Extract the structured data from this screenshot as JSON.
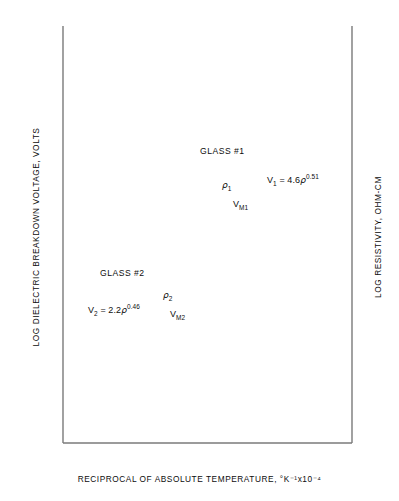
{
  "chart_data": {
    "type": "line",
    "title": "",
    "xlabel": "RECIPROCAL OF ABSOLUTE TEMPERATURE, °K⁻¹x10⁻⁴",
    "ylabel": "LOG DIELECTRIC BREAKDOWN VOLTAGE, VOLTS",
    "ylabel_right": "LOG RESISTIVITY, OHM-CM",
    "grid": false,
    "legend": "none",
    "x_axis": {
      "scale": "linear",
      "min": 24,
      "max": 18,
      "direction": "decreasing",
      "ticks": [
        24,
        23,
        22,
        21,
        20,
        19,
        18
      ]
    },
    "y_axis_left": {
      "scale": "log",
      "min": 100,
      "max": 6000,
      "label_decades": [
        "10²",
        "10³"
      ],
      "ticks": [
        {
          "value": 100,
          "label": "10²"
        },
        {
          "value": 150,
          "label": "1.5"
        },
        {
          "value": 200,
          "label": "2"
        },
        {
          "value": 300,
          "label": "3"
        },
        {
          "value": 400,
          "label": "4"
        },
        {
          "value": 500,
          "label": "5"
        },
        {
          "value": 600,
          "label": "6"
        },
        {
          "value": 700,
          "label": "7"
        },
        {
          "value": 800,
          "label": "8"
        },
        {
          "value": 900,
          "label": "9"
        },
        {
          "value": 1000,
          "label": "10³"
        },
        {
          "value": 1500,
          "label": "1.5"
        },
        {
          "value": 2000,
          "label": "2"
        },
        {
          "value": 3000,
          "label": "3"
        },
        {
          "value": 4000,
          "label": "4"
        },
        {
          "value": 5000,
          "label": "5"
        },
        {
          "value": 6000,
          "label": "6"
        }
      ]
    },
    "y_axis_right": {
      "scale": "log",
      "min": 100000,
      "max": 400000000,
      "ticks": [
        {
          "value": 100000,
          "label": "10⁵"
        },
        {
          "value": 100000,
          "label": "1"
        },
        {
          "value": 200000,
          "label": "2"
        },
        {
          "value": 400000,
          "label": "4"
        },
        {
          "value": 600000,
          "label": "6"
        },
        {
          "value": 800000,
          "label": "8"
        },
        {
          "value": 1000000,
          "label": "10⁶"
        },
        {
          "value": 1000000,
          "label": "1"
        },
        {
          "value": 2000000,
          "label": "2"
        },
        {
          "value": 4000000,
          "label": "4"
        },
        {
          "value": 6000000,
          "label": "6"
        },
        {
          "value": 8000000,
          "label": "8"
        },
        {
          "value": 10000000,
          "label": "10⁷"
        },
        {
          "value": 10000000,
          "label": "1"
        },
        {
          "value": 20000000,
          "label": "2"
        },
        {
          "value": 40000000,
          "label": "4"
        },
        {
          "value": 60000000,
          "label": "6"
        },
        {
          "value": 80000000,
          "label": "8"
        },
        {
          "value": 100000000,
          "label": "10⁸"
        },
        {
          "value": 100000000,
          "label": "1"
        },
        {
          "value": 200000000,
          "label": "2"
        },
        {
          "value": 400000000,
          "label": "4"
        }
      ]
    },
    "series": [
      {
        "name": "rho-1",
        "annotation": "ρ₁",
        "group": "GLASS #1",
        "x": [
          24,
          18
        ],
        "y_left": [
          5000,
          760
        ],
        "points_px": [
          [
            63,
            36
          ],
          [
            352,
            327
          ]
        ]
      },
      {
        "name": "V-M1",
        "annotation": "Vₘ₁",
        "group": "GLASS #1",
        "x": [
          24,
          18
        ],
        "y_left": [
          4000,
          620
        ],
        "points_px": [
          [
            63,
            54
          ],
          [
            352,
            345
          ]
        ]
      },
      {
        "name": "rho-2",
        "annotation": "ρ₂",
        "group": "GLASS #2",
        "x": [
          24,
          18
        ],
        "y_left": [
          2600,
          300
        ],
        "points_px": [
          [
            63,
            113
          ],
          [
            352,
            404
          ]
        ]
      },
      {
        "name": "V-M2",
        "annotation": "Vₘ₂",
        "group": "GLASS #2",
        "x": [
          24,
          18
        ],
        "y_left": [
          1600,
          185
        ],
        "points_px": [
          [
            63,
            134
          ],
          [
            352,
            425
          ]
        ]
      }
    ],
    "annotations": [
      {
        "id": "glass1",
        "text": "GLASS #1",
        "x_px": 200,
        "y_px": 153
      },
      {
        "id": "rho1",
        "text": "ρ₁",
        "x_px": 222,
        "y_px": 187
      },
      {
        "id": "vm1",
        "text": "Vₘ₁",
        "x_px": 233,
        "y_px": 206
      },
      {
        "id": "eq1",
        "text": "V₁ = 4.6ρ⁰·⁵¹",
        "x_px": 272,
        "y_px": 180
      },
      {
        "id": "glass2",
        "text": "GLASS #2",
        "x_px": 105,
        "y_px": 275
      },
      {
        "id": "eq2",
        "text": "V₂ = 2.2ρ⁰·⁴⁶",
        "x_px": 95,
        "y_px": 310
      },
      {
        "id": "rho2",
        "text": "ρ₂",
        "x_px": 166,
        "y_px": 296
      },
      {
        "id": "vm2",
        "text": "Vₘ₂",
        "x_px": 174,
        "y_px": 315
      }
    ]
  },
  "labels": {
    "glass1": "GLASS #1",
    "glass2": "GLASS #2",
    "eq1_lhs": "V",
    "eq1_sub": "1",
    "eq1_rhs": " = 4.6",
    "eq1_rho": "ρ",
    "eq1_exp": "0.51",
    "eq2_lhs": "V",
    "eq2_sub": "2",
    "eq2_rhs": " = 2.2",
    "eq2_rho": "ρ",
    "eq2_exp": "0.46",
    "rho1_base": "ρ",
    "rho1_sub": "1",
    "rho2_base": "ρ",
    "rho2_sub": "2",
    "vm1_base": "V",
    "vm1_sub": "M",
    "vm1_sub2": "1",
    "vm2_base": "V",
    "vm2_sub": "M",
    "vm2_sub2": "2",
    "xlabel": "RECIPROCAL OF ABSOLUTE TEMPERATURE, °K⁻¹x10⁻⁴",
    "ylabel_left": "LOG DIELECTRIC BREAKDOWN VOLTAGE, VOLTS",
    "ylabel_right": "LOG RESISTIVITY, OHM-CM"
  },
  "ticks_left": [
    {
      "label": "6",
      "y": 26
    },
    {
      "label": "5",
      "y": 36
    },
    {
      "label": "4",
      "y": 54
    },
    {
      "label": "3",
      "y": 81
    },
    {
      "label": "2",
      "y": 113
    },
    {
      "label": "1.5",
      "y": 134
    },
    {
      "label": "10³",
      "y": 182
    },
    {
      "label": "9",
      "y": 192
    },
    {
      "label": "8",
      "y": 202
    },
    {
      "label": "7",
      "y": 215
    },
    {
      "label": "6",
      "y": 229
    },
    {
      "label": "5",
      "y": 245
    },
    {
      "label": "4",
      "y": 266
    },
    {
      "label": "3",
      "y": 293
    },
    {
      "label": "2",
      "y": 325
    },
    {
      "label": "1.5",
      "y": 346
    },
    {
      "label": "10²",
      "y": 438
    }
  ],
  "ticks_left_minor_y": [
    26,
    36,
    54,
    81,
    113,
    134,
    182,
    192,
    202,
    215,
    229,
    245,
    266,
    293,
    325,
    346
  ],
  "ticks_right": [
    {
      "label": "4",
      "y": 26,
      "decade": ""
    },
    {
      "label": "2",
      "y": 60,
      "decade": ""
    },
    {
      "label": "1",
      "y": 86,
      "decade": "10⁸"
    },
    {
      "label": "8",
      "y": 98,
      "decade": ""
    },
    {
      "label": "6",
      "y": 113,
      "decade": ""
    },
    {
      "label": "4",
      "y": 136,
      "decade": ""
    },
    {
      "label": "2",
      "y": 170,
      "decade": ""
    },
    {
      "label": "1",
      "y": 196,
      "decade": "10⁷"
    },
    {
      "label": "8",
      "y": 208,
      "decade": ""
    },
    {
      "label": "6",
      "y": 223,
      "decade": ""
    },
    {
      "label": "4",
      "y": 246,
      "decade": ""
    },
    {
      "label": "2",
      "y": 280,
      "decade": ""
    },
    {
      "label": "1",
      "y": 306,
      "decade": "10⁶"
    },
    {
      "label": "8",
      "y": 318,
      "decade": ""
    },
    {
      "label": "6",
      "y": 333,
      "decade": ""
    },
    {
      "label": "4",
      "y": 356,
      "decade": ""
    },
    {
      "label": "2",
      "y": 390,
      "decade": ""
    },
    {
      "label": "1",
      "y": 438,
      "decade": "10⁵"
    }
  ],
  "ticks_x": [
    {
      "label": "24",
      "x": 63
    },
    {
      "label": "23",
      "x": 111
    },
    {
      "label": "22",
      "x": 159
    },
    {
      "label": "21",
      "x": 207
    },
    {
      "label": "20",
      "x": 256
    },
    {
      "label": "19",
      "x": 304
    },
    {
      "label": "18",
      "x": 352
    }
  ],
  "colors": {
    "axis": "#7a7a7a",
    "line": "#111111",
    "text": "#0d0d0d",
    "background": "#ffffff"
  }
}
